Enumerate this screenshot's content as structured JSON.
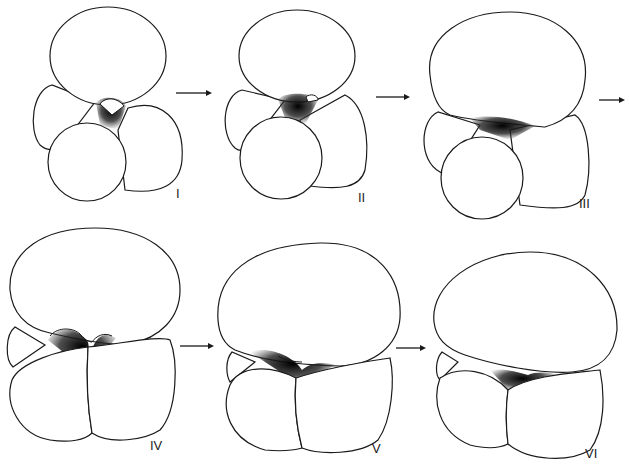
{
  "figure": {
    "stages": [
      {
        "id": "I",
        "label": "I"
      },
      {
        "id": "II",
        "label": "II"
      },
      {
        "id": "III",
        "label": "III"
      },
      {
        "id": "IV",
        "label": "IV"
      },
      {
        "id": "V",
        "label": "V"
      },
      {
        "id": "VI",
        "label": "VI"
      }
    ],
    "arrows": [
      "I→II",
      "II→III",
      "III→(IV)",
      "IV→V",
      "V→VI"
    ],
    "colors": {
      "line": "#1a1a1a",
      "background": "#ffffff",
      "shading": "#111111"
    }
  }
}
